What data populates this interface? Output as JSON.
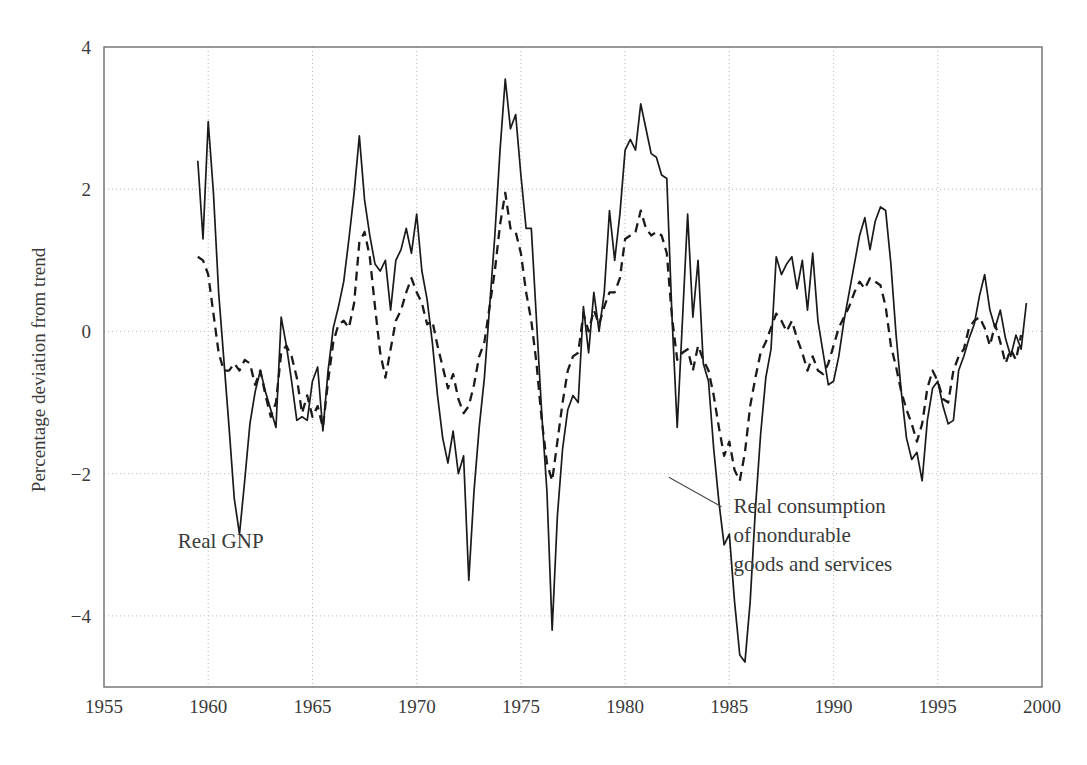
{
  "chart_data": {
    "type": "line",
    "title": "",
    "subtitle": "",
    "xlabel": "",
    "ylabel": "Percentage deviation from trend",
    "xlim": [
      1955,
      2000
    ],
    "ylim": [
      -5,
      4
    ],
    "xticks": [
      1955,
      1960,
      1965,
      1970,
      1975,
      1980,
      1985,
      1990,
      1995,
      2000
    ],
    "xtick_labels": [
      "1955",
      "1960",
      "1965",
      "1970",
      "1975",
      "1980",
      "1985",
      "1990",
      "1995",
      "2000"
    ],
    "yticks": [
      -4,
      -2,
      0,
      2,
      4
    ],
    "ytick_labels": [
      "-4",
      "-2",
      "0",
      "2",
      "4"
    ],
    "grid": "dotted gridlines at all labeled x and y ticks",
    "legend": "inline annotations",
    "annotations": [
      {
        "name": "real-gnp-label",
        "text": "Real GNP",
        "x": 1960.6,
        "y": -3.05
      },
      {
        "name": "real-consumption-label",
        "lines": [
          "Real consumption",
          "of nondurable",
          "goods and services"
        ],
        "x": 1985.2,
        "y": -2.55,
        "leader_from": [
          1982.1,
          -2.05
        ]
      }
    ],
    "series": [
      {
        "name": "Real GNP",
        "style": "solid",
        "color": "#1a1a1a",
        "x_start": 1959.5,
        "x_step": 0.25,
        "values": [
          2.4,
          1.3,
          2.95,
          1.95,
          0.55,
          -0.4,
          -1.35,
          -2.35,
          -2.85,
          -2.1,
          -1.3,
          -0.85,
          -0.55,
          -0.85,
          -1.1,
          -1.35,
          0.2,
          -0.2,
          -0.7,
          -1.25,
          -1.2,
          -1.25,
          -0.7,
          -0.5,
          -1.4,
          -0.55,
          0.05,
          0.35,
          0.7,
          1.3,
          1.95,
          2.75,
          1.85,
          1.35,
          0.95,
          0.85,
          1.0,
          0.3,
          1.0,
          1.15,
          1.45,
          1.1,
          1.65,
          0.85,
          0.45,
          -0.15,
          -0.9,
          -1.5,
          -1.85,
          -1.4,
          -2.0,
          -1.75,
          -3.5,
          -2.25,
          -1.35,
          -0.65,
          0.35,
          1.35,
          2.55,
          3.55,
          2.85,
          3.05,
          2.2,
          1.45,
          1.45,
          0.15,
          -1.15,
          -2.25,
          -4.2,
          -2.6,
          -1.65,
          -1.1,
          -0.9,
          -1.0,
          0.35,
          -0.3,
          0.55,
          0.0,
          0.55,
          1.7,
          1.0,
          1.65,
          2.55,
          2.7,
          2.55,
          3.2,
          2.85,
          2.5,
          2.45,
          2.2,
          2.15,
          0.2,
          -1.35,
          0.15,
          1.65,
          0.2,
          1.0,
          -0.45,
          -0.7,
          -1.65,
          -2.4,
          -3.0,
          -2.85,
          -3.8,
          -4.55,
          -4.65,
          -3.8,
          -2.5,
          -1.45,
          -0.65,
          -0.25,
          1.05,
          0.8,
          0.95,
          1.05,
          0.6,
          1.0,
          0.3,
          1.1,
          0.15,
          -0.3,
          -0.75,
          -0.7,
          -0.35,
          0.15,
          0.55,
          0.95,
          1.35,
          1.6,
          1.15,
          1.55,
          1.75,
          1.7,
          0.95,
          -0.05,
          -0.85,
          -1.5,
          -1.8,
          -1.7,
          -2.1,
          -1.25,
          -0.8,
          -0.7,
          -1.05,
          -1.3,
          -1.25,
          -0.55,
          -0.35,
          -0.1,
          0.1,
          0.5,
          0.8,
          0.3,
          0.05,
          0.3,
          -0.1,
          -0.35,
          -0.05,
          -0.25,
          0.4
        ]
      },
      {
        "name": "Real consumption of nondurable goods and services",
        "style": "dashed",
        "color": "#1a1a1a",
        "x_start": 1959.5,
        "x_step": 0.25,
        "values": [
          1.05,
          1.0,
          0.8,
          0.25,
          -0.3,
          -0.55,
          -0.55,
          -0.45,
          -0.55,
          -0.4,
          -0.45,
          -0.75,
          -0.55,
          -0.9,
          -1.2,
          -1.0,
          -0.3,
          -0.2,
          -0.35,
          -0.65,
          -1.15,
          -0.9,
          -1.2,
          -1.05,
          -1.35,
          -0.7,
          -0.15,
          0.1,
          0.15,
          0.05,
          0.4,
          1.25,
          1.4,
          1.05,
          0.35,
          -0.3,
          -0.65,
          -0.25,
          0.15,
          0.3,
          0.55,
          0.75,
          0.55,
          0.4,
          0.1,
          0.15,
          -0.2,
          -0.5,
          -0.8,
          -0.6,
          -0.95,
          -1.15,
          -1.05,
          -0.75,
          -0.35,
          -0.15,
          0.35,
          0.85,
          1.5,
          1.95,
          1.45,
          1.4,
          1.1,
          0.55,
          0.15,
          -0.45,
          -1.25,
          -1.85,
          -2.1,
          -1.55,
          -1.0,
          -0.55,
          -0.35,
          -0.3,
          0.25,
          0.0,
          0.3,
          0.1,
          0.35,
          0.55,
          0.55,
          0.75,
          1.3,
          1.35,
          1.4,
          1.7,
          1.45,
          1.35,
          1.4,
          1.35,
          1.1,
          0.2,
          -0.4,
          -0.3,
          -0.25,
          -0.55,
          -0.2,
          -0.4,
          -0.55,
          -0.9,
          -1.35,
          -1.75,
          -1.55,
          -1.95,
          -2.1,
          -1.7,
          -1.05,
          -0.65,
          -0.3,
          -0.15,
          0.05,
          0.25,
          0.15,
          0.0,
          0.15,
          -0.1,
          -0.3,
          -0.55,
          -0.35,
          -0.55,
          -0.6,
          -0.45,
          -0.2,
          0.05,
          0.2,
          0.35,
          0.55,
          0.7,
          0.6,
          0.75,
          0.7,
          0.65,
          0.35,
          -0.2,
          -0.5,
          -0.85,
          -1.1,
          -1.3,
          -1.55,
          -1.3,
          -0.8,
          -0.55,
          -0.7,
          -0.95,
          -1.0,
          -0.55,
          -0.35,
          -0.25,
          0.05,
          0.15,
          0.2,
          0.05,
          -0.2,
          0.1,
          -0.15,
          -0.45,
          -0.25,
          -0.4,
          -0.05
        ]
      }
    ]
  },
  "axes": {
    "ylabel": "Percentage deviation from trend"
  }
}
